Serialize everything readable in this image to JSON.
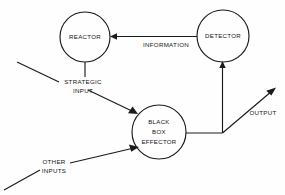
{
  "diagram": {
    "background_color": "#fefefe",
    "stroke_color": "#1a1a1a",
    "text_color": "#141414",
    "nodes": [
      {
        "id": "reactor",
        "label": "REACTOR",
        "shape": "circle",
        "cx": 85,
        "cy": 37,
        "r": 25,
        "lines": [
          "REACTOR"
        ]
      },
      {
        "id": "detector",
        "label": "DETECTOR",
        "shape": "circle",
        "cx": 223,
        "cy": 36,
        "r": 26,
        "lines": [
          "DETECTOR"
        ]
      },
      {
        "id": "black-box-effector",
        "label": "BLACK BOX EFFECTOR",
        "shape": "circle",
        "cx": 159,
        "cy": 132,
        "r": 27,
        "lines": [
          "BLACK",
          "BOX",
          "EFFECTOR"
        ]
      }
    ],
    "edge_labels": [
      {
        "id": "information",
        "text": "INFORMATION",
        "x": 166,
        "y": 45
      },
      {
        "id": "strategic-input",
        "lines": [
          "STRATEGIC",
          "INPUT"
        ],
        "line1": "STRATEGIC",
        "line2": "INPUT",
        "x": 83,
        "y": 83
      },
      {
        "id": "other-inputs",
        "lines": [
          "OTHER",
          "INPUTS"
        ],
        "line1": "OTHER",
        "line2": "INPUTS",
        "x": 54,
        "y": 165
      },
      {
        "id": "output",
        "text": "OUTPUT",
        "x": 263,
        "y": 113
      }
    ],
    "connections": [
      {
        "id": "detector-to-reactor",
        "label": "INFORMATION",
        "from": "detector",
        "to": "reactor",
        "direction": "left",
        "arrow": true
      },
      {
        "id": "reactor-to-strategic-input",
        "label": "",
        "from": "reactor",
        "to": "strategic-input",
        "direction": "down",
        "arrow": false
      },
      {
        "id": "strategic-input-to-black-box",
        "label": "STRATEGIC INPUT",
        "from": "strategic-input",
        "to": "black-box-effector",
        "direction": "down-right",
        "arrow": true
      },
      {
        "id": "other-inputs-to-black-box",
        "label": "OTHER INPUTS",
        "from": "other-inputs",
        "to": "black-box-effector",
        "direction": "up-right",
        "arrow": true
      },
      {
        "id": "black-box-to-junction",
        "label": "",
        "from": "black-box-effector",
        "to": "junction",
        "direction": "right",
        "arrow": false
      },
      {
        "id": "junction-to-detector",
        "label": "",
        "from": "junction",
        "to": "detector",
        "direction": "up",
        "arrow": true
      },
      {
        "id": "junction-to-output",
        "label": "OUTPUT",
        "from": "junction",
        "to": "output",
        "direction": "up-right",
        "arrow": true
      }
    ]
  }
}
